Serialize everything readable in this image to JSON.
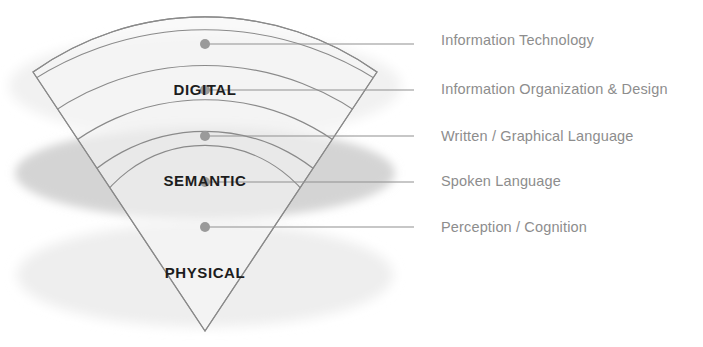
{
  "diagram": {
    "tiers": [
      {
        "id": "digital",
        "label": "DIGITAL",
        "x": 205,
        "y": 95,
        "ellipse_cy": 86,
        "ellipse_rx": 196,
        "ellipse_ry": 52,
        "fill": "#f0f0f0"
      },
      {
        "id": "semantic",
        "label": "SEMANTIC",
        "x": 205,
        "y": 186,
        "ellipse_cy": 173,
        "ellipse_rx": 190,
        "ellipse_ry": 46,
        "fill": "#d3d3d3"
      },
      {
        "id": "physical",
        "label": "PHYSICAL",
        "x": 205,
        "y": 278,
        "ellipse_cy": 275,
        "ellipse_rx": 188,
        "ellipse_ry": 52,
        "fill": "#eeeeee"
      }
    ],
    "callouts": [
      {
        "id": "information-technology",
        "label": "Information Technology",
        "dot_x": 205,
        "dot_y": 44,
        "line_y": 44,
        "text_x": 441,
        "text_y": 41,
        "dash_x1": 414,
        "dash_x2": 432
      },
      {
        "id": "information-organization-and-design",
        "label": "Information Organization & Design",
        "dot_x": 205,
        "dot_y": 90,
        "line_y": 90,
        "text_x": 441,
        "text_y": 90,
        "dash_x1": 414,
        "dash_x2": 432
      },
      {
        "id": "written-graphical-language",
        "label": "Written / Graphical Language",
        "dot_x": 205,
        "dot_y": 136,
        "line_y": 136,
        "text_x": 441,
        "text_y": 137,
        "dash_x1": 414,
        "dash_x2": 432
      },
      {
        "id": "spoken-language",
        "label": "Spoken Language",
        "dot_x": 205,
        "dot_y": 182,
        "line_y": 182,
        "text_x": 441,
        "text_y": 182,
        "dash_x1": 414,
        "dash_x2": 432
      },
      {
        "id": "perception-cognition",
        "label": "Perception / Cognition",
        "dot_x": 205,
        "dot_y": 227,
        "line_y": 227,
        "text_x": 441,
        "text_y": 228,
        "dash_x1": 414,
        "dash_x2": 432
      }
    ],
    "cone": {
      "apex_x": 205,
      "apex_y": 331,
      "left_corner_x": 33,
      "left_corner_y": 72,
      "right_corner_x": 377,
      "right_corner_y": 72
    },
    "arcs": [
      {
        "id": "arc-outer",
        "center_y": 28
      },
      {
        "id": "arc-2",
        "center_y": 72
      },
      {
        "id": "arc-3",
        "center_y": 117
      },
      {
        "id": "arc-4",
        "center_y": 162
      },
      {
        "id": "arc-5",
        "center_y": 207
      }
    ],
    "colors": {
      "stroke": "#8a8a8a",
      "tier_text": "#1d1d1d",
      "callout_text": "#8d8d8d",
      "dot": "#9a9a9a",
      "semantic_fill": "#d3d3d3",
      "physical_fill": "#eeeeee",
      "digital_fill": "#f0f0f0",
      "background": "#ffffff"
    }
  }
}
